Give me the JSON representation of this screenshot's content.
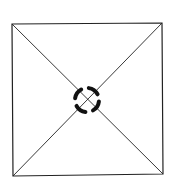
{
  "diagram": {
    "stroke_color": "#222222",
    "marker_color": "#111111",
    "square": {
      "top_left": [
        12,
        24
      ],
      "top_right": [
        162,
        23
      ],
      "bottom_right": [
        163,
        174
      ],
      "bottom_left": [
        13,
        176
      ]
    },
    "center_marker": {
      "cx": 87,
      "cy": 100,
      "r": 12,
      "segments": 4,
      "style": "dashed-ring"
    }
  }
}
